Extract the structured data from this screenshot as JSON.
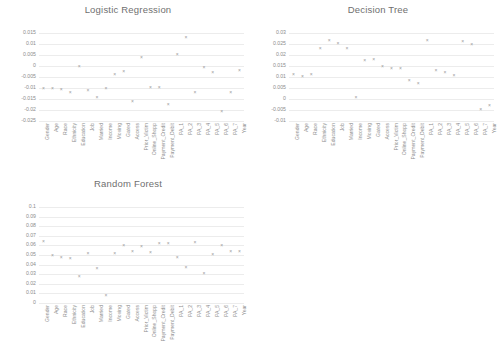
{
  "figure": {
    "background": "#ffffff",
    "marker_glyph": "×",
    "marker_color": "#9a9a9a",
    "grid_color": "#ececec",
    "text_color": "#8d8d8d"
  },
  "categories": [
    "Gender",
    "Age",
    "Race",
    "Ethnicity",
    "Education",
    "Job",
    "Married",
    "Income",
    "Moving",
    "Gated",
    "Access",
    "Prior_Victim",
    "Online_Shopp",
    "Payment_Credit",
    "Payment_Debit",
    "PA_1",
    "PA_2",
    "PA_3",
    "PA_4",
    "PA_5",
    "PA_6",
    "PA_7",
    "Year"
  ],
  "chart_data": [
    {
      "type": "scatter",
      "title": "Logistic Regression",
      "xlabel": "",
      "ylabel": "",
      "ylim": [
        -0.025,
        0.015
      ],
      "yticks": [
        0.015,
        0.01,
        0.005,
        0,
        -0.005,
        -0.01,
        -0.015,
        -0.02,
        -0.025
      ],
      "ytick_labels": [
        "0.015",
        "0.01",
        "0.005",
        "0",
        "-0.005",
        "-0.01",
        "-0.015",
        "-0.02",
        "-0.025"
      ],
      "grid": true,
      "legend": "none",
      "categories": [
        "Gender",
        "Age",
        "Race",
        "Ethnicity",
        "Education",
        "Job",
        "Married",
        "Income",
        "Moving",
        "Gated",
        "Access",
        "Prior_Victim",
        "Online_Shopp",
        "Payment_Credit",
        "Payment_Debit",
        "PA_1",
        "PA_2",
        "PA_3",
        "PA_4",
        "PA_5",
        "PA_6",
        "PA_7",
        "Year"
      ],
      "values": [
        -0.0098,
        -0.0098,
        -0.0103,
        -0.0118,
        0.0002,
        -0.0108,
        -0.014,
        -0.01,
        -0.0035,
        -0.0022,
        -0.0158,
        0.0043,
        -0.0097,
        -0.0097,
        -0.0172,
        0.0054,
        0.0132,
        -0.0117,
        -0.0004,
        -0.0028,
        -0.0203,
        -0.012,
        -0.0018
      ]
    },
    {
      "type": "scatter",
      "title": "Decision Tree",
      "xlabel": "",
      "ylabel": "",
      "ylim": [
        -0.01,
        0.03
      ],
      "yticks": [
        0.03,
        0.025,
        0.02,
        0.015,
        0.01,
        0.005,
        0,
        -0.005,
        -0.01
      ],
      "ytick_labels": [
        "0.03",
        "0.025",
        "0.02",
        "0.015",
        "0.01",
        "0.005",
        "0",
        "-0.005",
        "-0.01"
      ],
      "grid": true,
      "legend": "none",
      "categories": [
        "Gender",
        "Age",
        "Race",
        "Ethnicity",
        "Education",
        "Job",
        "Married",
        "Income",
        "Moving",
        "Gated",
        "Access",
        "Prior_Victim",
        "Online_Shopp",
        "Payment_Credit",
        "Payment_Debit",
        "PA_1",
        "PA_2",
        "PA_3",
        "PA_4",
        "PA_5",
        "PA_6",
        "PA_7",
        "Year"
      ],
      "values": [
        0.0113,
        0.0103,
        0.0113,
        0.0232,
        0.0268,
        0.0254,
        0.0232,
        0.0008,
        0.0177,
        0.018,
        0.0152,
        0.014,
        0.014,
        0.0085,
        0.0075,
        0.0268,
        0.0133,
        0.0123,
        0.0108,
        0.0265,
        0.0248,
        -0.0046,
        -0.0026
      ]
    },
    {
      "type": "scatter",
      "title": "Random Forest",
      "xlabel": "",
      "ylabel": "",
      "ylim": [
        0,
        0.1
      ],
      "yticks": [
        0.1,
        0.09,
        0.08,
        0.07,
        0.06,
        0.05,
        0.04,
        0.03,
        0.02,
        0.01,
        0
      ],
      "ytick_labels": [
        "0.1",
        "0.09",
        "0.08",
        "0.07",
        "0.06",
        "0.05",
        "0.04",
        "0.03",
        "0.02",
        "0.01",
        "0"
      ],
      "grid": true,
      "legend": "none",
      "categories": [
        "Gender",
        "Age",
        "Race",
        "Ethnicity",
        "Education",
        "Job",
        "Married",
        "Income",
        "Moving",
        "Gated",
        "Access",
        "Prior_Victim",
        "Online_Shopp",
        "Payment_Credit",
        "Payment_Debit",
        "PA_1",
        "PA_2",
        "PA_3",
        "PA_4",
        "PA_5",
        "PA_6",
        "PA_7",
        "Year"
      ],
      "values": [
        0.0645,
        0.0495,
        0.048,
        0.047,
        0.0285,
        0.052,
        0.036,
        0.0085,
        0.052,
        0.06,
        0.054,
        0.059,
        0.0535,
        0.062,
        0.0625,
        0.048,
        0.0375,
        0.064,
        0.0315,
        0.051,
        0.06,
        0.0545,
        0.0545
      ]
    }
  ]
}
